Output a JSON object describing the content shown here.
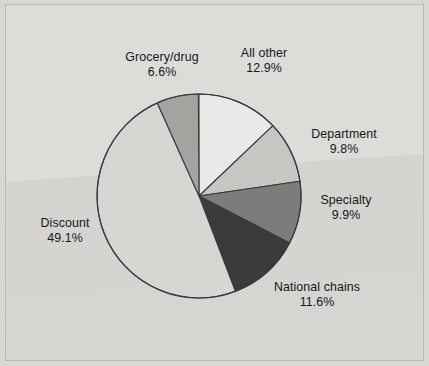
{
  "figure": {
    "background_color": "#d7d7d4",
    "frame_color": "#b9b9b6",
    "title": ""
  },
  "chart_data": {
    "type": "pie",
    "title": "",
    "subtitle": "",
    "xlabel": "",
    "ylabel": "",
    "legend_position": "none",
    "grid": false,
    "label_format": "name above percent",
    "start_angle_deg": 0,
    "direction": "clockwise",
    "categories": [
      "All other",
      "Department",
      "Specialty",
      "National chains",
      "Discount",
      "Grocery/drug"
    ],
    "values": [
      12.9,
      9.8,
      9.9,
      11.6,
      49.1,
      6.6
    ],
    "units": "percent",
    "total": 99.9,
    "slices": [
      {
        "name": "All other",
        "value": 12.9,
        "value_label": "12.9%",
        "color": "#e9e9e7",
        "start_deg": 0,
        "end_deg": 46.44,
        "label_name": "All other",
        "label_value": "12.9%"
      },
      {
        "name": "Department",
        "value": 9.8,
        "value_label": "9.8%",
        "color": "#c6c6c3",
        "start_deg": 46.44,
        "end_deg": 81.72,
        "label_name": "Department",
        "label_value": "9.8%"
      },
      {
        "name": "Specialty",
        "value": 9.9,
        "value_label": "9.9%",
        "color": "#7c7c7a",
        "start_deg": 81.72,
        "end_deg": 117.36,
        "label_name": "Specialty",
        "label_value": "9.9%"
      },
      {
        "name": "National chains",
        "value": 11.6,
        "value_label": "11.6%",
        "color": "#3b3b3a",
        "start_deg": 117.36,
        "end_deg": 159.12,
        "label_name": "National chains",
        "label_value": "11.6%"
      },
      {
        "name": "Discount",
        "value": 49.1,
        "value_label": "49.1%",
        "color": "#d6d6d3",
        "start_deg": 159.12,
        "end_deg": 335.88,
        "label_name": "Discount",
        "label_value": "49.1%"
      },
      {
        "name": "Grocery/drug",
        "value": 6.6,
        "value_label": "6.6%",
        "color": "#a3a3a0",
        "start_deg": 335.88,
        "end_deg": 359.64,
        "label_name": "Grocery/drug",
        "label_value": "6.6%"
      }
    ],
    "geometry": {
      "center_x": 199,
      "center_y": 196,
      "radius": 102,
      "outline_color": "#3a3a3a"
    }
  }
}
